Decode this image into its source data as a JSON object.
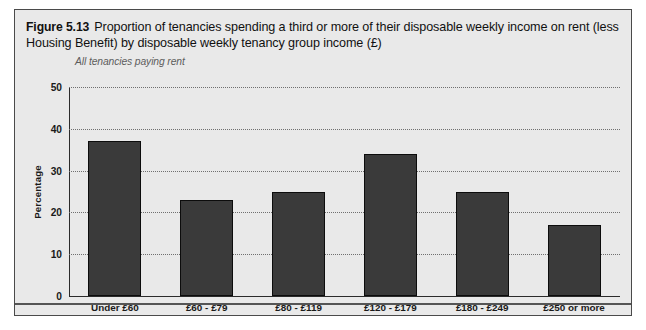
{
  "figure": {
    "number": "Figure 5.13",
    "title": "Proportion of tenancies spending a third or more of their disposable weekly income on rent (less Housing Benefit) by disposable weekly tenancy group income (£)",
    "subtitle": "All tenancies paying rent"
  },
  "chart_data": {
    "type": "bar",
    "title": "Proportion of tenancies spending a third or more of their disposable weekly income on rent (less Housing Benefit) by disposable weekly tenancy group income (£)",
    "subtitle": "All tenancies paying rent",
    "categories": [
      "Under £60",
      "£60 - £79",
      "£80 - £119",
      "£120 - £179",
      "£180 - £249",
      "£250 or more"
    ],
    "values": [
      37,
      23,
      25,
      34,
      25,
      17
    ],
    "xlabel": "",
    "ylabel": "Percentage",
    "ylim": [
      0,
      50
    ],
    "yticks": [
      0,
      10,
      20,
      30,
      40,
      50
    ],
    "grid": true,
    "legend": false,
    "bar_color": "#3a3a3a",
    "bar_edge_color": "#0c0c0c",
    "background_color": "#e9e9e9"
  }
}
